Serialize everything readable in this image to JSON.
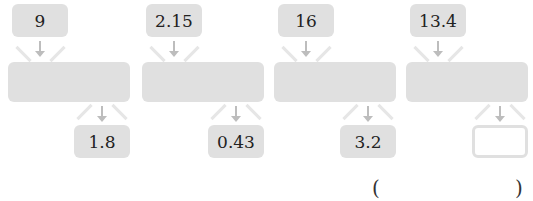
{
  "units": [
    {
      "input": "9",
      "output": "1.8"
    },
    {
      "input": "2.15",
      "output": "0.43"
    },
    {
      "input": "16",
      "output": "3.2"
    },
    {
      "input": "13.4",
      "output": ""
    }
  ],
  "answer": {
    "open": "(",
    "close": ")",
    "value": ""
  },
  "colors": {
    "box_fill": "#e0e0e0",
    "arrow": "#bdbdbd"
  }
}
